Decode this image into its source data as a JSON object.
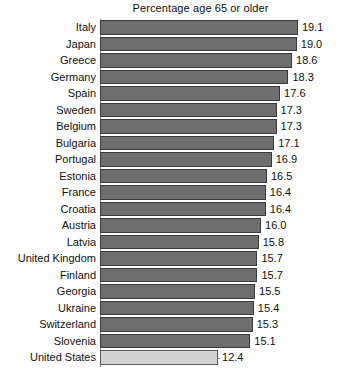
{
  "chart_data": {
    "type": "bar",
    "orientation": "horizontal",
    "title": "Percentage age 65 or older",
    "xlabel": "",
    "ylabel": "",
    "categories": [
      "Italy",
      "Japan",
      "Greece",
      "Germany",
      "Spain",
      "Sweden",
      "Belgium",
      "Bulgaria",
      "Portugal",
      "Estonia",
      "France",
      "Croatia",
      "Austria",
      "Latvia",
      "United Kingdom",
      "Finland",
      "Georgia",
      "Ukraine",
      "Switzerland",
      "Slovenia",
      "United States"
    ],
    "values": [
      19.1,
      19.0,
      18.6,
      18.3,
      17.6,
      17.3,
      17.3,
      17.1,
      16.9,
      16.5,
      16.4,
      16.4,
      16.0,
      15.8,
      15.7,
      15.7,
      15.5,
      15.4,
      15.3,
      15.1,
      12.4
    ],
    "value_labels": [
      "19.1",
      "19.0",
      "18.6",
      "18.3",
      "17.6",
      "17.3",
      "17.3",
      "17.1",
      "16.9",
      "16.5",
      "16.4",
      "16.4",
      "16.0",
      "15.8",
      "15.7",
      "15.7",
      "15.5",
      "15.4",
      "15.3",
      "15.1",
      "12.4"
    ],
    "highlight_category": "United States",
    "xlim": [
      2.5,
      21.0
    ],
    "grid": false,
    "legend": null,
    "bar_color": "#6e6e6e",
    "highlight_color": "#d2d2d2",
    "bar_edge_color": "#3a3a3a",
    "axis_color": "#8a8a8a",
    "text_color": "#111111",
    "background": "#ffffff"
  }
}
